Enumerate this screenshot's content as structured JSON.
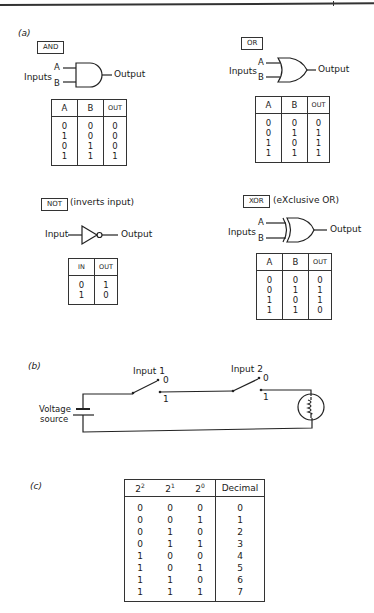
{
  "panels": {
    "a": {
      "label": "(a)",
      "gates": {
        "and": {
          "name": "AND",
          "inputs_label": "Inputs",
          "input_a": "A",
          "input_b": "B",
          "output_label": "Output",
          "table": {
            "headers": [
              "A",
              "B",
              "OUT"
            ],
            "rows": [
              [
                "0",
                "0",
                "0"
              ],
              [
                "1",
                "0",
                "0"
              ],
              [
                "0",
                "1",
                "0"
              ],
              [
                "1",
                "1",
                "1"
              ]
            ]
          }
        },
        "or": {
          "name": "OR",
          "inputs_label": "Inputs",
          "input_a": "A",
          "input_b": "B",
          "output_label": "Output",
          "table": {
            "headers": [
              "A",
              "B",
              "OUT"
            ],
            "rows": [
              [
                "0",
                "0",
                "0"
              ],
              [
                "0",
                "1",
                "1"
              ],
              [
                "1",
                "0",
                "1"
              ],
              [
                "1",
                "1",
                "1"
              ]
            ]
          }
        },
        "not": {
          "name": "NOT",
          "note": "(inverts input)",
          "input_label": "Input",
          "output_label": "Output",
          "table": {
            "headers": [
              "IN",
              "OUT"
            ],
            "rows": [
              [
                "0",
                "1"
              ],
              [
                "1",
                "0"
              ]
            ]
          }
        },
        "xor": {
          "name": "XOR",
          "note": "(eXclusive OR)",
          "inputs_label": "Inputs",
          "input_a": "A",
          "input_b": "B",
          "output_label": "Output",
          "table": {
            "headers": [
              "A",
              "B",
              "OUT"
            ],
            "rows": [
              [
                "0",
                "0",
                "0"
              ],
              [
                "0",
                "1",
                "1"
              ],
              [
                "1",
                "0",
                "1"
              ],
              [
                "1",
                "1",
                "0"
              ]
            ]
          }
        }
      }
    },
    "b": {
      "label": "(b)",
      "switch1": {
        "label": "Input 1",
        "pos0": "0",
        "pos1": "1"
      },
      "switch2": {
        "label": "Input 2",
        "pos0": "0",
        "pos1": "1"
      },
      "source_line1": "Voltage",
      "source_line2": "source"
    },
    "c": {
      "label": "(c)",
      "headers": {
        "b2_base": "2",
        "b2_exp": "2",
        "b1_base": "2",
        "b1_exp": "1",
        "b0_base": "2",
        "b0_exp": "0",
        "decimal": "Decimal"
      },
      "rows": [
        [
          "0",
          "0",
          "0",
          "0"
        ],
        [
          "0",
          "0",
          "1",
          "1"
        ],
        [
          "0",
          "1",
          "0",
          "2"
        ],
        [
          "0",
          "1",
          "1",
          "3"
        ],
        [
          "1",
          "0",
          "0",
          "4"
        ],
        [
          "1",
          "0",
          "1",
          "5"
        ],
        [
          "1",
          "1",
          "0",
          "6"
        ],
        [
          "1",
          "1",
          "1",
          "7"
        ]
      ]
    }
  }
}
